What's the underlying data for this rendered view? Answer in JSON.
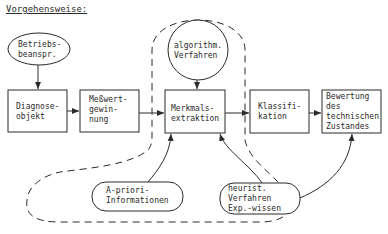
{
  "title": "Vorgehensweise:",
  "nodes": {
    "betriebsbeanspr": {
      "label": "Betriebs-\nbeanspr.",
      "shape": "ellipse"
    },
    "diagnoseobjekt": {
      "label": "Diagnose-\nobjekt",
      "shape": "box"
    },
    "messwertgewinnung": {
      "label": "Meßwert-\ngewin-\nnung",
      "shape": "box"
    },
    "algorithm": {
      "label": "algorithm.\nVerfahren",
      "shape": "circle"
    },
    "merkmalsextraktion": {
      "label": "Merkmals-\nextraktion",
      "shape": "box"
    },
    "klassifikation": {
      "label": "Klassifi-\nkation",
      "shape": "box"
    },
    "bewertung": {
      "label": "Bewertung\ndes\ntechnischen\nZustandes",
      "shape": "box"
    },
    "apriori": {
      "label": "A-priori-\nInformationen",
      "shape": "ellipse"
    },
    "heurist": {
      "label": "heurist.\nVerfahren\nExp.-wissen",
      "shape": "ellipse"
    }
  },
  "edges": [
    {
      "from": "betriebsbeanspr",
      "to": "diagnoseobjekt"
    },
    {
      "from": "diagnoseobjekt",
      "to": "messwertgewinnung"
    },
    {
      "from": "messwertgewinnung",
      "to": "merkmalsextraktion"
    },
    {
      "from": "algorithm",
      "to": "merkmalsextraktion"
    },
    {
      "from": "merkmalsextraktion",
      "to": "klassifikation"
    },
    {
      "from": "klassifikation",
      "to": "bewertung"
    },
    {
      "from": "apriori",
      "to": "merkmalsextraktion"
    },
    {
      "from": "heurist",
      "to": "merkmalsextraktion"
    },
    {
      "from": "heurist",
      "to": "bewertung"
    }
  ],
  "colors": {
    "stroke": "#2a2a2a",
    "background": "#ffffff"
  }
}
